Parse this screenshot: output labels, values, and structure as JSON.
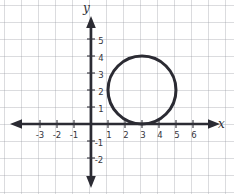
{
  "figure": {
    "background_color": "#ffffff",
    "grid_color": "#96989f",
    "ink_color": "#2b2b33"
  },
  "axes": {
    "x_axis_label": "x",
    "y_axis_label": "y",
    "origin_label": "",
    "x_tick_labels": [
      "-3",
      "-2",
      "-1",
      "1",
      "2",
      "3",
      "4",
      "5",
      "6"
    ],
    "y_tick_labels": [
      "5",
      "4",
      "3",
      "2",
      "1",
      "-1",
      "-2"
    ]
  },
  "chart_data": {
    "type": "scatter",
    "title": "",
    "xlabel": "x",
    "ylabel": "y",
    "grid": true,
    "legend": "none",
    "xlim": [
      -4.6,
      7.2
    ],
    "ylim": [
      -3.2,
      6.4
    ],
    "x_ticks": [
      -3,
      -2,
      -1,
      1,
      2,
      3,
      4,
      5,
      6
    ],
    "y_ticks": [
      5,
      4,
      3,
      2,
      1,
      -1,
      -2
    ],
    "shapes": [
      {
        "kind": "circle",
        "center_x": 3,
        "center_y": 2,
        "radius": 2,
        "stroke": "#2b2b33",
        "stroke_width": 3,
        "fill": "none"
      }
    ]
  }
}
